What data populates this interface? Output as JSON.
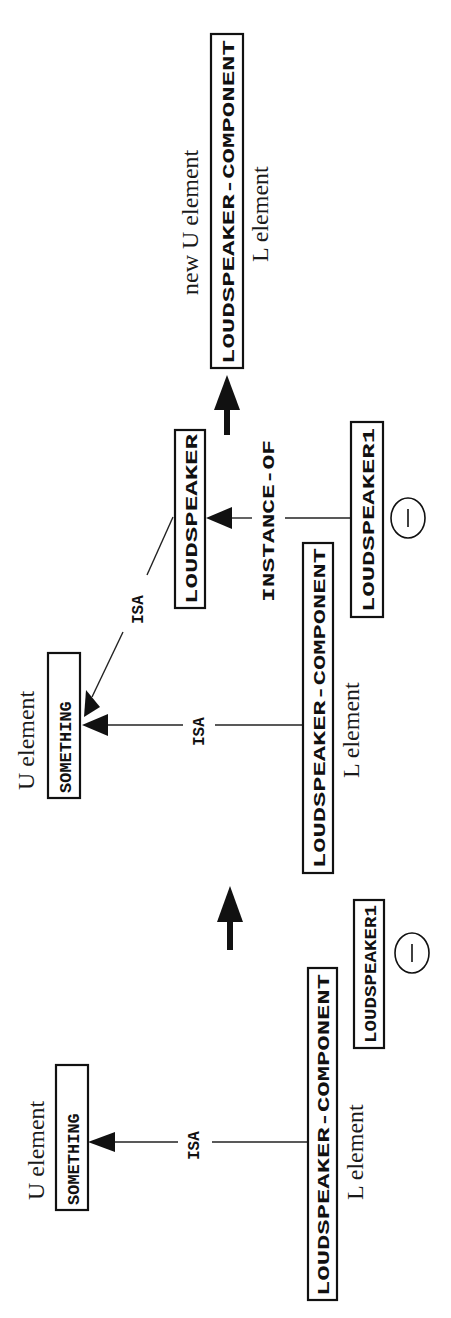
{
  "diagram": {
    "orientation": "rotated-90-ccw",
    "panels": [
      {
        "id": "before",
        "u_element_label": "U element",
        "l_element_label": "L element",
        "nodes": {
          "something": "SOMETHING",
          "loudspeaker_component": "LOUDSPEAKER-COMPONENT",
          "loudspeaker1": "LOUDSPEAKER1"
        },
        "edges": [
          {
            "from": "LOUDSPEAKER-COMPONENT",
            "to": "SOMETHING",
            "label": "ISA"
          }
        ],
        "minus_symbol": "−"
      },
      {
        "id": "middle",
        "u_element_label": "U element",
        "l_element_label": "L element",
        "nodes": {
          "something": "SOMETHING",
          "loudspeaker": "LOUDSPEAKER",
          "loudspeaker_component": "LOUDSPEAKER-COMPONENT",
          "loudspeaker1": "LOUDSPEAKER1"
        },
        "edges": [
          {
            "from": "LOUDSPEAKER-COMPONENT",
            "to": "SOMETHING",
            "label": "ISA"
          },
          {
            "from": "LOUDSPEAKER",
            "to": "SOMETHING",
            "label": "ISA"
          },
          {
            "from": "LOUDSPEAKER1",
            "to": "LOUDSPEAKER",
            "label": "INSTANCE-OF"
          }
        ],
        "minus_symbol": "−"
      },
      {
        "id": "after",
        "new_u_element_label": "new U element",
        "l_element_label": "L element",
        "nodes": {
          "loudspeaker_component": "LOUDSPEAKER-COMPONENT"
        }
      }
    ],
    "transition_arrows": 2
  }
}
